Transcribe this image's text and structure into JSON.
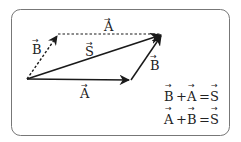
{
  "diagram": {
    "colors": {
      "stroke": "#1a1a1a",
      "border": "#777777",
      "background": "#ffffff"
    },
    "vectors": [
      {
        "id": "A_solid",
        "label": "A",
        "style": "solid",
        "from": [
          27,
          79
        ],
        "to": [
          131,
          80
        ]
      },
      {
        "id": "B_solid",
        "label": "B",
        "style": "solid",
        "from": [
          131,
          80
        ],
        "to": [
          163,
          34
        ]
      },
      {
        "id": "S",
        "label": "S",
        "style": "solid",
        "from": [
          27,
          79
        ],
        "to": [
          163,
          34
        ]
      },
      {
        "id": "B_dashed",
        "label": "B",
        "style": "dashed",
        "from": [
          27,
          79
        ],
        "to": [
          58,
          34
        ]
      },
      {
        "id": "A_dashed",
        "label": "A",
        "style": "dashed",
        "from": [
          58,
          34
        ],
        "to": [
          163,
          34
        ]
      }
    ],
    "labels": {
      "a_top": "A",
      "b_left": "B",
      "s_mid": "S",
      "b_right": "B",
      "a_bottom": "A",
      "arrow": "→"
    },
    "equations": [
      {
        "lhs1": "B",
        "op": "+",
        "lhs2": "A",
        "eq": "=",
        "rhs": "S"
      },
      {
        "lhs1": "A",
        "op": "+",
        "lhs2": "B",
        "eq": "=",
        "rhs": "S"
      }
    ]
  }
}
